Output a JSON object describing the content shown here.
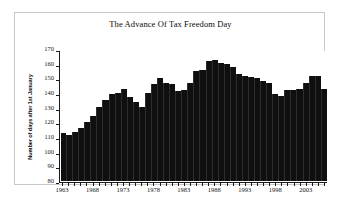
{
  "chart_data": {
    "type": "bar",
    "title": "The Advance Of Tax Freedom Day",
    "xlabel": "",
    "ylabel": "Number of days after 1st January",
    "ylim": [
      80,
      170
    ],
    "ytick_step": 10,
    "yticks": [
      80,
      90,
      100,
      110,
      120,
      130,
      140,
      150,
      160,
      170
    ],
    "xtick_labels": [
      "1963",
      "1968",
      "1973",
      "1978",
      "1983",
      "1988",
      "1993",
      "1998",
      "2003"
    ],
    "xtick_step": 5,
    "grid": false,
    "legend": null,
    "bar_color": "#100f10",
    "plot_background": "#ffffff",
    "categories": [
      "1963",
      "1964",
      "1965",
      "1966",
      "1967",
      "1968",
      "1969",
      "1970",
      "1971",
      "1972",
      "1973",
      "1974",
      "1975",
      "1976",
      "1977",
      "1978",
      "1979",
      "1980",
      "1981",
      "1982",
      "1983",
      "1984",
      "1985",
      "1986",
      "1987",
      "1988",
      "1989",
      "1990",
      "1991",
      "1992",
      "1993",
      "1994",
      "1995",
      "1996",
      "1997",
      "1998",
      "1999",
      "2000",
      "2001",
      "2002",
      "2003",
      "2004",
      "2005",
      "2006"
    ],
    "values": [
      113,
      112,
      114,
      117,
      121,
      125,
      131,
      136,
      140,
      141,
      144,
      138,
      135,
      131,
      141,
      147,
      151,
      148,
      147,
      142,
      143,
      148,
      156,
      157,
      163,
      164,
      162,
      161,
      159,
      154,
      153,
      152,
      151,
      149,
      148,
      140,
      139,
      143,
      143,
      144,
      148,
      153,
      153,
      144
    ]
  }
}
